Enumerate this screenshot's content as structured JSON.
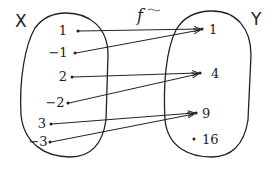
{
  "function_label": "f",
  "domain_set": {
    "label": "X",
    "elements": [
      "1",
      "-1",
      "2",
      "-2",
      "3",
      "-3"
    ]
  },
  "codomain_set": {
    "label": "Y",
    "elements": [
      "1",
      "4",
      "9",
      "16"
    ]
  },
  "mappings": [
    {
      "from": "1",
      "to": "1"
    },
    {
      "from": "-1",
      "to": "1"
    },
    {
      "from": "2",
      "to": "4"
    },
    {
      "from": "-2",
      "to": "4"
    },
    {
      "from": "3",
      "to": "9"
    },
    {
      "from": "-3",
      "to": "9"
    }
  ],
  "colors": {
    "stroke": "#222222",
    "background": "#ffffff"
  }
}
